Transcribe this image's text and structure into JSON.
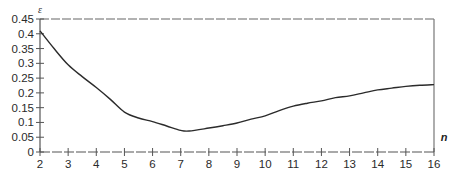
{
  "chart_data": {
    "type": "line",
    "title": "",
    "xlabel": "n",
    "ylabel": "ε",
    "xlim": [
      2,
      16
    ],
    "ylim": [
      0,
      0.45
    ],
    "x_ticks": [
      2,
      3,
      4,
      5,
      6,
      7,
      8,
      9,
      10,
      11,
      12,
      13,
      14,
      15,
      16
    ],
    "x_tick_labels": [
      "2",
      "3",
      "4",
      "5",
      "6",
      "7",
      "8",
      "9",
      "10",
      "11",
      "12",
      "13",
      "14",
      "15",
      "16"
    ],
    "y_ticks": [
      0,
      0.05,
      0.1,
      0.15,
      0.2,
      0.25,
      0.3,
      0.35,
      0.4,
      0.45
    ],
    "y_tick_labels": [
      "0",
      "0.05",
      "0.1",
      "0.15",
      "0.2",
      "0.25",
      "0.3",
      "0.35",
      "0.4",
      "0.45"
    ],
    "grid": false,
    "legend": "none",
    "series": [
      {
        "name": "ε",
        "color": "#2b2b2b",
        "x": [
          2,
          2.5,
          3,
          3.5,
          4,
          4.5,
          5,
          5.5,
          6,
          6.5,
          7,
          7.3,
          8,
          8.5,
          9,
          9.5,
          10,
          10.5,
          11,
          11.5,
          12,
          12.5,
          13,
          13.5,
          14,
          14.5,
          15,
          15.5,
          16
        ],
        "values": [
          0.41,
          0.35,
          0.295,
          0.255,
          0.218,
          0.178,
          0.135,
          0.115,
          0.103,
          0.088,
          0.073,
          0.071,
          0.081,
          0.089,
          0.098,
          0.111,
          0.122,
          0.14,
          0.155,
          0.165,
          0.173,
          0.184,
          0.19,
          0.2,
          0.21,
          0.216,
          0.222,
          0.226,
          0.228
        ]
      }
    ]
  }
}
